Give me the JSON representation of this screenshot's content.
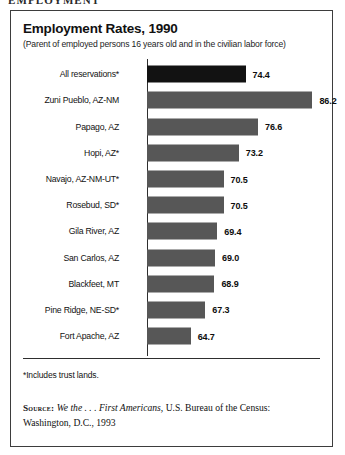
{
  "page": {
    "running_header": "EMPLOYMENT"
  },
  "figure": {
    "title": "Employment Rates, 1990",
    "subtitle": "(Parent of employed persons 16 years old and in the civilian labor force)",
    "footnote": "*Includes trust lands.",
    "source": {
      "label": "Source:",
      "title_italic": "We the . . . First Americans,",
      "rest": " U.S. Bureau of the Census:",
      "line2": "Washington, D.C., 1993"
    }
  },
  "colors": {
    "highlight_bar": "#121212",
    "bar": "#575757",
    "frame": "#3d3d3d",
    "text": "#141414"
  },
  "chart_data": {
    "type": "bar",
    "orientation": "horizontal",
    "title": "Employment Rates, 1990",
    "subtitle": "(Parent of employed persons 16 years old and in the civilian labor force)",
    "xlabel": "",
    "ylabel": "",
    "value_suffix": "",
    "grid": false,
    "legend": false,
    "axis_origin": 57,
    "axis_max": 90,
    "categories": [
      "All reservations*",
      "Zuni Pueblo, AZ-NM",
      "Papago, AZ",
      "Hopi, AZ*",
      "Navajo, AZ-NM-UT*",
      "Rosebud, SD*",
      "Gila River, AZ",
      "San Carlos, AZ",
      "Blackfeet, MT",
      "Pine Ridge, NE-SD*",
      "Fort Apache, AZ"
    ],
    "values": [
      74.4,
      86.2,
      76.6,
      73.2,
      70.5,
      70.5,
      69.4,
      69.0,
      68.9,
      67.3,
      64.7
    ],
    "value_labels": [
      "74.4",
      "86.2",
      "76.6",
      "73.2",
      "70.5",
      "70.5",
      "69.4",
      "69.0",
      "68.9",
      "67.3",
      "64.7"
    ],
    "highlight_index": 0
  }
}
